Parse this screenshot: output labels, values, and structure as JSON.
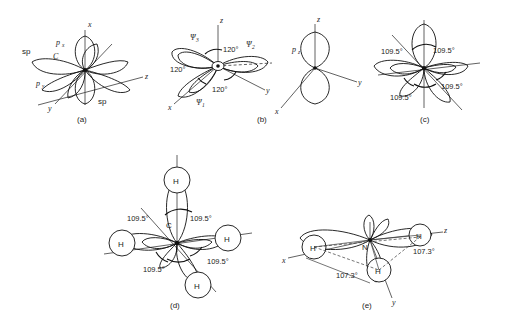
{
  "figure": {
    "background_color": "#ffffff",
    "line_color": "#111111",
    "panels": [
      {
        "id": "a",
        "caption": "(a)",
        "kind": "sp-hybrid-orbitals",
        "center_atom": "C",
        "axes": [
          "x",
          "y",
          "z"
        ],
        "labels": [
          "sp",
          "sp",
          "px",
          "py",
          "C"
        ],
        "label_texts": {
          "sp_upper_left": "sp",
          "sp_lower_right": "sp",
          "p_x": "p",
          "p_x_sub": "x",
          "p_y": "p",
          "p_y_sub": "y",
          "center": "C"
        }
      },
      {
        "id": "b",
        "caption": "(b)",
        "kind": "sp2-hybrid-orbitals-with-pz",
        "axes": [
          "x",
          "y",
          "z"
        ],
        "orbital_labels": [
          "Ψ",
          "Ψ",
          "Ψ"
        ],
        "orbital_subscripts": [
          "1",
          "2",
          "3"
        ],
        "angles": [
          "120°",
          "120°",
          "120°"
        ],
        "side_orbital": "p",
        "side_orbital_sub": "z",
        "side_axes": [
          "x",
          "y",
          "z"
        ]
      },
      {
        "id": "c",
        "caption": "(c)",
        "kind": "sp3-hybrid-orbitals",
        "angles": [
          "109.5°",
          "109.5°",
          "109.5°",
          "109.5°"
        ]
      },
      {
        "id": "d",
        "caption": "(d)",
        "kind": "methane-sp3",
        "center_atom": "C",
        "atoms": [
          "H",
          "H",
          "H",
          "H"
        ],
        "angles": [
          "109.5°",
          "109.5°",
          "109.5°",
          "109.5°"
        ]
      },
      {
        "id": "e",
        "caption": "(e)",
        "kind": "ammonia-sp3",
        "center_atom": "N",
        "atoms": [
          "H",
          "H",
          "H"
        ],
        "angles": [
          "107.3°",
          "107.3°"
        ],
        "axes": [
          "x",
          "y",
          "z"
        ]
      }
    ]
  }
}
